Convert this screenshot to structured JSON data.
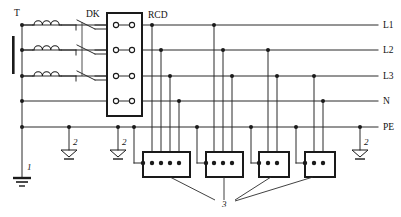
{
  "diagram": {
    "type": "electrical-single-line",
    "background_color": "#ffffff",
    "line_color": "#2b2b2b"
  },
  "labels": {
    "transformer": "T",
    "disconnector": "DK",
    "rcd": "RCD",
    "earth_electrode_main": "1",
    "earth_electrode_repeat": "2",
    "socket_outlet": "3"
  },
  "rails": [
    {
      "id": "L1",
      "label": "L1",
      "y": 25
    },
    {
      "id": "L2",
      "label": "L2",
      "y": 50
    },
    {
      "id": "L3",
      "label": "L3",
      "y": 76
    },
    {
      "id": "N",
      "label": "N",
      "y": 101
    },
    {
      "id": "PE",
      "label": "PE",
      "y": 127
    }
  ],
  "components": {
    "transformer": {
      "name": "T",
      "core_bar": {
        "x": 14,
        "y_top": 36,
        "y_bottom": 74
      },
      "windings": 3,
      "winding_label": "coil"
    },
    "disconnector": {
      "name": "DK",
      "poles": 3,
      "state": "open"
    },
    "rcd": {
      "name": "RCD",
      "terminal_rows": 4,
      "terminal_columns": 2,
      "box": {
        "x": 107,
        "y": 13,
        "width": 35,
        "height": 103
      }
    },
    "sockets": [
      {
        "index": 1,
        "label": "3",
        "poles": 5,
        "box": {
          "x": 143,
          "y": 152,
          "width": 47,
          "height": 25
        }
      },
      {
        "index": 2,
        "label": "3",
        "poles": 3,
        "box": {
          "x": 206,
          "y": 152,
          "width": 37,
          "height": 25
        }
      },
      {
        "index": 3,
        "label": "3",
        "poles": 3,
        "box": {
          "x": 259,
          "y": 152,
          "width": 30,
          "height": 25
        }
      },
      {
        "index": 4,
        "label": "3",
        "poles": 3,
        "box": {
          "x": 305,
          "y": 152,
          "width": 30,
          "height": 25
        }
      }
    ],
    "earths": [
      {
        "label": "1",
        "x": 22,
        "y": 178,
        "kind": "main"
      },
      {
        "label": "2",
        "x": 69,
        "y": 152,
        "kind": "repeated"
      },
      {
        "label": "2",
        "x": 118,
        "y": 152,
        "kind": "repeated"
      },
      {
        "label": "2",
        "x": 360,
        "y": 152,
        "kind": "repeated"
      }
    ]
  },
  "legend_keys": [
    {
      "key": "1",
      "meaning": "main earthing electrode"
    },
    {
      "key": "2",
      "meaning": "repeated earthing of PE"
    },
    {
      "key": "3",
      "meaning": "socket outlet"
    }
  ]
}
